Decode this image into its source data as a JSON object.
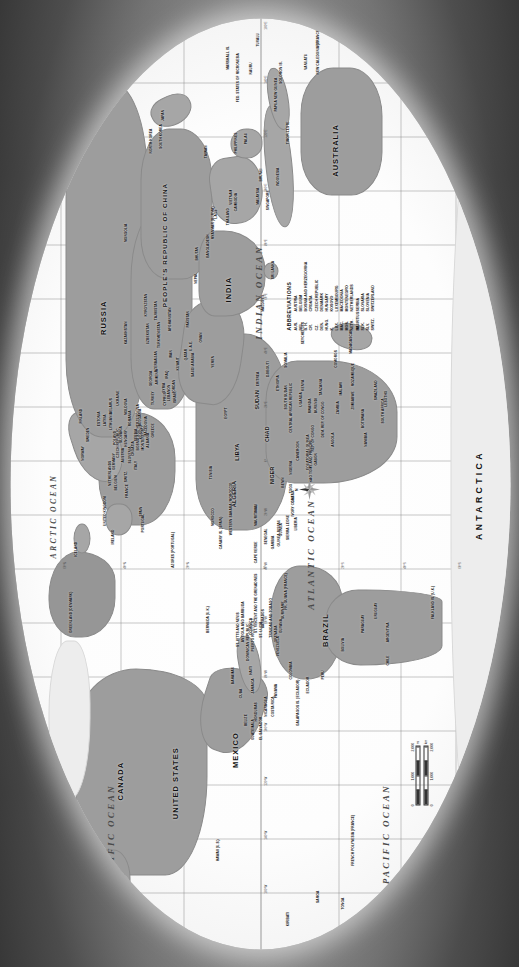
{
  "map": {
    "projection_note": "oval world map, rotated 90 degrees counter-clockwise",
    "colors": {
      "land": "#9d9d9d",
      "ocean": "#fdfdfd",
      "ice": "#ededed",
      "frame": "#7a7a7a",
      "graticule": "#787878"
    },
    "oceans": [
      {
        "name": "PACIFIC OCEAN",
        "x": 12.5,
        "y": 20.5
      },
      {
        "name": "PACIFIC OCEAN",
        "x": 12.5,
        "y": 76.0
      },
      {
        "name": "ATLANTIC OCEAN",
        "x": 41.0,
        "y": 60.5
      },
      {
        "name": "INDIAN OCEAN",
        "x": 69.5,
        "y": 50.0
      },
      {
        "name": "ARCTIC OCEAN",
        "x": 46.0,
        "y": 9.0
      }
    ],
    "continents": [
      {
        "name": "ANTARCTICA",
        "x": 55.0,
        "y": 94.5
      },
      {
        "name": "AUSTRALIA",
        "x": 85.5,
        "y": 68.0
      }
    ],
    "major_countries": [
      {
        "name": "CANADA",
        "x": 24.0,
        "y": 25.0
      },
      {
        "name": "UNITED STATES",
        "x": 23.5,
        "y": 36.5
      },
      {
        "name": "MEXICO",
        "x": 23.5,
        "y": 47.5
      },
      {
        "name": "BRAZIL",
        "x": 36.0,
        "y": 64.5
      },
      {
        "name": "RUSSIA",
        "x": 62.0,
        "y": 22.0
      },
      {
        "name": "PEOPLE'S REPUBLIC OF CHINA",
        "x": 71.0,
        "y": 33.5
      },
      {
        "name": "INDIA",
        "x": 70.5,
        "y": 44.5
      },
      {
        "name": "ALGERIA",
        "x": 48.5,
        "y": 48.0
      },
      {
        "name": "LIBYA",
        "x": 52.5,
        "y": 48.0
      },
      {
        "name": "NIGER",
        "x": 50.0,
        "y": 54.5
      },
      {
        "name": "CHAD",
        "x": 54.0,
        "y": 54.5
      },
      {
        "name": "SUDAN",
        "x": 57.5,
        "y": 52.0
      },
      {
        "name": "GREENLAND (DENMARK)",
        "x": 38.5,
        "y": 15.0
      }
    ],
    "labels": [
      "ALASKA (U.S.)",
      "GREENLAND (DENMARK)",
      "ICELAND",
      "NORWAY",
      "SWEDEN",
      "FINLAND",
      "ESTONIA",
      "LATVIA",
      "LITHUANIA",
      "BELARUS",
      "POLAND",
      "GERMANY",
      "NETHERLANDS",
      "BELGIUM",
      "FRANCE",
      "SPAIN",
      "PORTUGAL",
      "IRELAND",
      "UNITED KINGDOM",
      "SWITZ.",
      "ITALY",
      "AUSTRIA",
      "CZECH REPUBLIC",
      "SLOVAKIA",
      "HUNGARY",
      "SLOVENIA",
      "CROATIA",
      "BOSNIA AND HERZEGOVINA",
      "SERBIA",
      "MONTENEGRO",
      "KOSOVO",
      "MACEDONIA",
      "ALBANIA",
      "GREECE",
      "BULGARIA",
      "ROMANIA",
      "MOLDOVA",
      "UKRAINE",
      "TURKEY",
      "CYPRUS",
      "SYRIA",
      "LEBANON",
      "ISRAEL",
      "JORDAN",
      "IRAQ",
      "IRAN",
      "KUWAIT",
      "SAUDI ARABIA",
      "QATAR",
      "U.A.E.",
      "OMAN",
      "YEMEN",
      "GEORGIA",
      "ARMENIA",
      "AZERBAIJAN",
      "KAZAKHSTAN",
      "UZBEKISTAN",
      "TURKMENISTAN",
      "TAJIKISTAN",
      "KYRGYZSTAN",
      "AFGHANISTAN",
      "PAKISTAN",
      "NEPAL",
      "BHUTAN",
      "BANGLADESH",
      "MYANMAR (BURMA)",
      "THAILAND",
      "LAOS",
      "VIETNAM",
      "CAMBODIA",
      "MALAYSIA",
      "SINGAPORE",
      "INDONESIA",
      "BRUNEI",
      "PHILIPPINES",
      "TAIWAN",
      "MONGOLIA",
      "NORTH KOREA",
      "SOUTH KOREA",
      "JAPAN",
      "SRI LANKA",
      "MALDIVES",
      "PAPUA NEW GUINEA",
      "NEW ZEALAND",
      "FIJI",
      "VANUATU",
      "SOLOMON IS.",
      "SAMOA",
      "TONGA",
      "PALAU",
      "TIMOR-LESTE",
      "MOROCCO",
      "WESTERN SAHARA (MOROCCO)",
      "TUNISIA",
      "EGYPT",
      "MAURITANIA",
      "MALI",
      "SENEGAL",
      "GAMBIA",
      "GUINEA-BISSAU",
      "GUINEA",
      "SIERRA LEONE",
      "LIBERIA",
      "IVORY COAST",
      "GHANA",
      "TOGO",
      "BENIN",
      "NIGERIA",
      "CAMEROON",
      "EQUATORIAL GUINEA",
      "GABON",
      "REP. OF CONGO",
      "DEM. REP. OF CONGO",
      "CENTRAL AFRICAN REPUBLIC",
      "SOUTH SUDAN",
      "ERITREA",
      "DJIBOUTI",
      "ETHIOPIA",
      "SOMALIA",
      "KENYA",
      "UGANDA",
      "RWANDA",
      "BURUNDI",
      "TANZANIA",
      "ZAMBIA",
      "ANGOLA",
      "MALAWI",
      "MOZAMBIQUE",
      "ZIMBABWE",
      "BOTSWANA",
      "NAMIBIA",
      "SOUTH AFRICA",
      "LESOTHO",
      "SWAZILAND",
      "MADAGASCAR",
      "COMOROS",
      "MAURITIUS",
      "SEYCHELLES",
      "CAPE VERDE",
      "SAO TOME AND PRINCIPE",
      "GUATEMALA",
      "BELIZE",
      "EL SALVADOR",
      "HONDURAS",
      "NICARAGUA",
      "COSTA RICA",
      "PANAMA",
      "CUBA",
      "JAMAICA",
      "HAITI",
      "DOMINICAN REPUBLIC",
      "BAHAMAS",
      "PUERTO RICO (U.S.)",
      "TRINIDAD AND TOBAGO",
      "BARBADOS",
      "ST. LUCIA",
      "ANTIGUA AND BARBUDA",
      "ST. KITTS AND NEVIS",
      "DOMINICA",
      "GRENADA",
      "ST. VINCENT AND THE GRENADINES",
      "COLOMBIA",
      "VENEZUELA",
      "GUYANA",
      "SURINAME",
      "FR. GUIANA (FRANCE)",
      "ECUADOR",
      "PERU",
      "BOLIVIA",
      "PARAGUAY",
      "CHILE",
      "ARGENTINA",
      "URUGUAY",
      "FALKLAND IS. (U.K.)",
      "BERMUDA (U.K.)",
      "AZORES (PORTUGAL)",
      "CANARY IS. (SPAIN)",
      "FRENCH POLYNESIA (FRANCE)",
      "HAWAII (U.S.)",
      "KIRIBATI",
      "TUVALU",
      "NAURU",
      "MARSHALL IS.",
      "FED. STATES OF MICRONESIA",
      "NEW CALEDONIA (FRANCE)",
      "GALAPAGOS IS. (ECUADOR)"
    ]
  },
  "abbreviations": {
    "title": "ABBREVIATIONS",
    "entries": [
      {
        "abbr": "AUS.",
        "full": "AUSTRIA"
      },
      {
        "abbr": "BEL.",
        "full": "BELGIUM"
      },
      {
        "abbr": "B. H.",
        "full": "BOSNIA AND HERZEGOVINA"
      },
      {
        "abbr": "CR.",
        "full": "CROATIA"
      },
      {
        "abbr": "CZ.",
        "full": "CZECH REPUBLIC"
      },
      {
        "abbr": "DEN.",
        "full": "DENMARK"
      },
      {
        "abbr": "HUNG.",
        "full": "HUNGARY"
      },
      {
        "abbr": "K.",
        "full": "KOSOVO"
      },
      {
        "abbr": "LUX.",
        "full": "LUXEMBOURG"
      },
      {
        "abbr": "MAC.",
        "full": "MACEDONIA"
      },
      {
        "abbr": "MON.",
        "full": "MONTENEGRO"
      },
      {
        "abbr": "NETH.",
        "full": "NETHERLANDS"
      },
      {
        "abbr": "SE.",
        "full": "SERBIA"
      },
      {
        "abbr": "SLK.",
        "full": "SLOVAKIA"
      },
      {
        "abbr": "SLV.",
        "full": "SLOVENIA"
      },
      {
        "abbr": "SWITZ.",
        "full": "SWITZERLAND"
      }
    ]
  },
  "scale": {
    "miles": {
      "ticks": [
        "0",
        "1,000",
        "2,000"
      ],
      "unit": "mi"
    },
    "kilometers": {
      "ticks": [
        "0",
        "1,000",
        "2,000"
      ],
      "unit": "km"
    }
  },
  "compass": {
    "north_label": "N"
  },
  "graticule": {
    "longitudes": [
      "160°W",
      "140°W",
      "120°W",
      "100°W",
      "80°W",
      "60°W",
      "40°W",
      "20°W",
      "0°",
      "20°E",
      "40°E",
      "60°E",
      "80°E",
      "100°E",
      "120°E",
      "140°E",
      "160°E"
    ],
    "latitudes": [
      "80°N",
      "60°N",
      "40°N",
      "20°N",
      "0°",
      "20°S",
      "40°S",
      "60°S",
      "80°S"
    ]
  }
}
